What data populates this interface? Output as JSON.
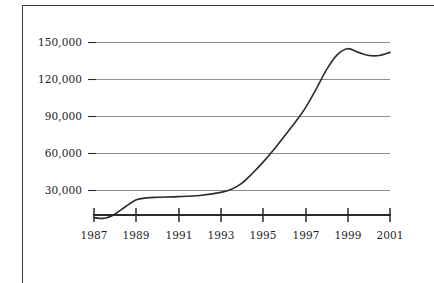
{
  "figure": {
    "background_color": "#ffffff",
    "frame_color": "#3a3a3a",
    "gridline_color": "#8c8c8c",
    "axis_color": "#2b2b2b",
    "line_color": "#2b2b2b"
  },
  "chart_data": {
    "type": "line",
    "title": "",
    "xlabel": "",
    "ylabel": "",
    "xlim": [
      1987,
      2001
    ],
    "ylim": [
      0,
      160000
    ],
    "grid": true,
    "legend": null,
    "x_tick_labels": [
      "1987",
      "1989",
      "1991",
      "1993",
      "1995",
      "1997",
      "1999",
      "2001"
    ],
    "x_tick_values": [
      1987,
      1989,
      1991,
      1993,
      1995,
      1997,
      1999,
      2001
    ],
    "y_tick_labels": [
      "30,000",
      "60,000",
      "90,000",
      "120,000",
      "150,000"
    ],
    "y_tick_values": [
      30000,
      60000,
      90000,
      120000,
      150000
    ],
    "series": [
      {
        "name": "",
        "x": [
          1987,
          1987.5,
          1988,
          1988.5,
          1989,
          1989.5,
          1990,
          1991,
          1992,
          1993,
          1993.5,
          1994,
          1994.5,
          1995,
          1995.5,
          1996,
          1996.5,
          1997,
          1997.5,
          1998,
          1998.5,
          1999,
          1999.5,
          2000,
          2000.5,
          2001
        ],
        "values": [
          8000,
          7500,
          11000,
          17000,
          22500,
          24000,
          24500,
          25000,
          26000,
          28500,
          31000,
          36000,
          44000,
          53000,
          63000,
          74000,
          85000,
          97000,
          112000,
          128000,
          140000,
          145000,
          142000,
          139500,
          139500,
          142000
        ]
      }
    ]
  }
}
